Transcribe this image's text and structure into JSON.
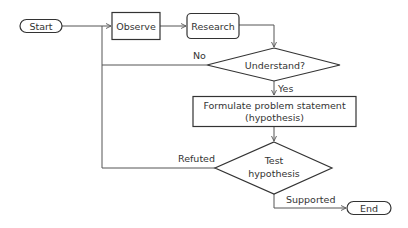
{
  "diagram": {
    "type": "flowchart",
    "nodes": {
      "start": {
        "label": "Start",
        "shape": "terminator"
      },
      "observe": {
        "label": "Observe",
        "shape": "process"
      },
      "research": {
        "label": "Research",
        "shape": "rounded-process"
      },
      "understand": {
        "label": "Understand?",
        "shape": "decision"
      },
      "formulate": {
        "line1": "Formulate problem statement",
        "line2": "(hypothesis)",
        "shape": "process"
      },
      "test": {
        "line1": "Test",
        "line2": "hypothesis",
        "shape": "decision"
      },
      "end": {
        "label": "End",
        "shape": "terminator"
      }
    },
    "edges": {
      "no": {
        "label": "No",
        "from": "understand",
        "to": "observe"
      },
      "yes": {
        "label": "Yes",
        "from": "understand",
        "to": "formulate"
      },
      "refuted": {
        "label": "Refuted",
        "from": "test",
        "to": "observe"
      },
      "supported": {
        "label": "Supported",
        "from": "test",
        "to": "end"
      }
    },
    "colors": {
      "stroke": "#333333",
      "edge": "#555555",
      "fill": "#ffffff",
      "text": "#333333"
    }
  }
}
